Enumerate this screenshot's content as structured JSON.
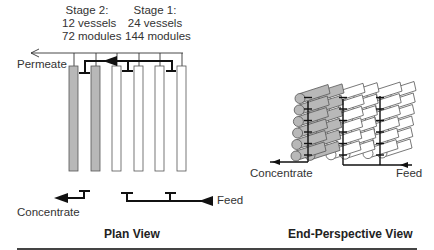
{
  "plan_view": {
    "title": "Plan View",
    "stage2": {
      "line1": "Stage 2:",
      "line2": "12 vessels",
      "line3": "72 modules"
    },
    "stage1": {
      "line1": "Stage 1:",
      "line2": "24 vessels",
      "line3": "144 modules"
    },
    "permeate_label": "Permeate",
    "concentrate_label": "Concentrate",
    "feed_label": "Feed"
  },
  "end_view": {
    "title": "End-Perspective View",
    "concentrate_label": "Concentrate",
    "feed_label": "Feed"
  },
  "colors": {
    "stage2_fill": "#b8b8b8",
    "stage1_fill": "#ffffff",
    "line": "#111111"
  }
}
